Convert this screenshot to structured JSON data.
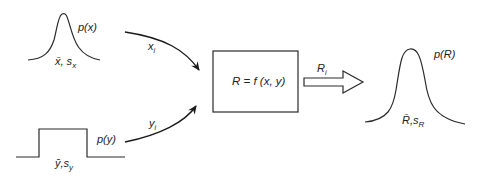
{
  "diagram": {
    "type": "monte-carlo-propagation",
    "inputs": [
      {
        "id": "x",
        "distribution_label": "p(x)",
        "shape": "normal",
        "stats_label": "x̄, sₓ",
        "sample_label": "xᵢ"
      },
      {
        "id": "y",
        "distribution_label": "p(y)",
        "shape": "uniform",
        "stats_label": "ȳ,s_y",
        "sample_label": "yᵢ"
      }
    ],
    "function_box": {
      "label": "R = f (x, y)"
    },
    "output_arrow": {
      "label": "Rᵢ"
    },
    "output": {
      "distribution_label": "p(R)",
      "shape": "normal",
      "stats_label": "R̄,s_R"
    }
  },
  "labels": {
    "px": "p(x)",
    "xbar_sx_main": "x̄, s",
    "xbar_sx_sub": "x",
    "xi_main": "x",
    "xi_sub": "i",
    "py": "p(y)",
    "ybar_sy_main": "ȳ,s",
    "ybar_sy_sub": "y",
    "yi_main": "y",
    "yi_sub": "i",
    "box_eq": "R = f (x, y)",
    "ri_main": "R",
    "ri_sub": "i",
    "pr": "p(R)",
    "rbar_sr_main": "R̄,s",
    "rbar_sr_sub": "R"
  }
}
